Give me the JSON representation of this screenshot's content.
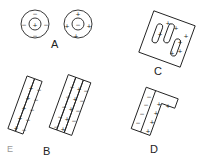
{
  "figure": {
    "labels": {
      "a": "A",
      "b": "B",
      "c": "C",
      "d": "D",
      "stray": "E"
    },
    "colors": {
      "ink": "#222222",
      "background": "#ffffff"
    },
    "panels": [
      {
        "id": "A",
        "description": "Two concentric circle arrangements: left has + center with - around; right has - center with + around",
        "left": {
          "center": "+",
          "ring": [
            "-",
            "-",
            "-",
            "-"
          ]
        },
        "right": {
          "center": "-",
          "ring": [
            "+",
            "+",
            "+",
            "+"
          ]
        }
      },
      {
        "id": "B",
        "description": "Two tilted strip assemblies; left has 2 strips (+ column, - column); right has 3 strips (- , + , -)",
        "left_strips": [
          [
            "+",
            "+",
            "+",
            "+",
            "+"
          ],
          [
            "-",
            "-",
            "-",
            "-",
            "-"
          ]
        ],
        "right_strips": [
          [
            "-",
            "-",
            "-",
            "-",
            "-"
          ],
          [
            "+",
            "+",
            "+",
            "+",
            "+"
          ],
          [
            "-",
            "-",
            "-",
            "-"
          ]
        ]
      },
      {
        "id": "C",
        "description": "Rotated square containing three rounded slots with + signs scattered around"
      },
      {
        "id": "D",
        "description": "Tilted L-shape: left strip of - signs, right strip with + signs extending into a top arm",
        "minus": [
          "-",
          "-",
          "-",
          "-"
        ],
        "plus": [
          "+",
          "+",
          "+",
          "+",
          "+",
          "+"
        ]
      }
    ]
  }
}
